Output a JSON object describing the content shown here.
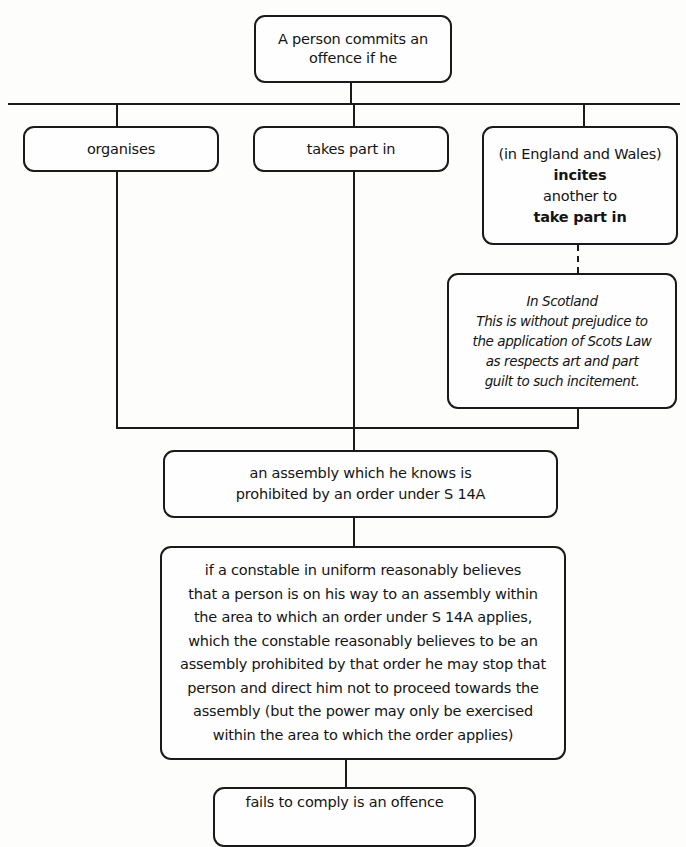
{
  "diagram": {
    "root": {
      "lines": [
        "A person commits an",
        "offence if he"
      ]
    },
    "branches": {
      "organises": "organises",
      "takes_part_in": "takes part in",
      "incites": {
        "qualifier": "(in England and Wales)",
        "verb": "incites",
        "object": "another to",
        "action": "take part in"
      }
    },
    "scotland_note": {
      "heading": "In Scotland",
      "lines": [
        "This is without prejudice to",
        "the application of Scots Law",
        "as respects art and part",
        "guilt to such incitement."
      ]
    },
    "assembly": {
      "lines": [
        "an assembly which he knows is",
        "prohibited by an order under S 14A"
      ]
    },
    "constable": {
      "lines": [
        "if a constable in uniform reasonably believes",
        "that a person is on his way to an assembly within",
        "the area to which an order under S 14A applies,",
        "which the constable reasonably believes to be an",
        "assembly prohibited by that order he may stop that",
        "person and direct him not to proceed towards the",
        "assembly (but the power may only be exercised",
        "within the area to which the order applies)"
      ]
    },
    "outcome": {
      "text": "fails to comply is an offence"
    }
  }
}
